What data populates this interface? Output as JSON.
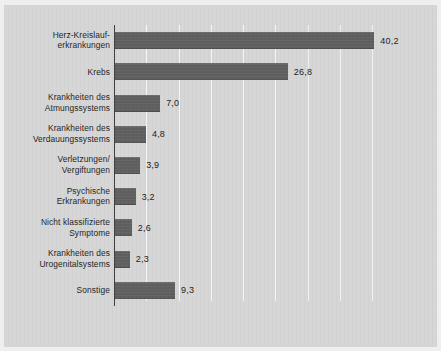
{
  "chart_data": {
    "type": "bar",
    "orientation": "horizontal",
    "title": "",
    "subtitle": "",
    "xlabel": "",
    "ylabel": "",
    "xlim": [
      0,
      45
    ],
    "grid": true,
    "gridlines_every": 5,
    "gridline_values": [
      5,
      10,
      15,
      20,
      25,
      30,
      35,
      40
    ],
    "legend": "none",
    "decimal_separator": ",",
    "categories": [
      "Herz-Kreislauf-\nerkrankungen",
      "Krebs",
      "Krankheiten des\nAtmungssystems",
      "Krankheiten des\nVerdauungssystems",
      "Verletzungen/\nVergiftungen",
      "Psychische\nErkrankungen",
      "Nicht klassifizierte\nSymptome",
      "Krankheiten des\nUrogenitalsystems",
      "Sonstige"
    ],
    "values": [
      40.2,
      26.8,
      7.0,
      4.8,
      3.9,
      3.2,
      2.6,
      2.3,
      9.3
    ],
    "value_labels": [
      "40,2",
      "26,8",
      "7,0",
      "4,8",
      "3,9",
      "3,2",
      "2,6",
      "2,3",
      "9,3"
    ],
    "colors": {
      "bar": "#5f5f5f",
      "background": "#d6d6d6",
      "axis": "#3c3c3c",
      "gridline": "#ffffff",
      "text": "#1d1d1d"
    }
  }
}
